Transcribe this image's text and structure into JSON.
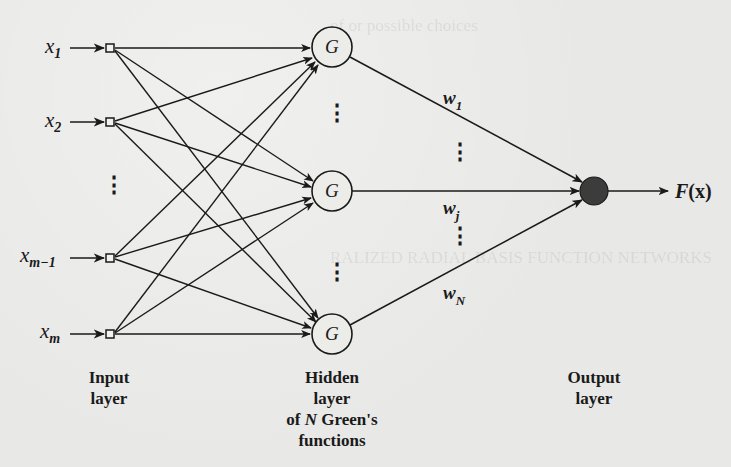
{
  "diagram": {
    "type": "radial-basis-function-network",
    "inputs": {
      "labels": [
        {
          "base": "x",
          "sub": "1"
        },
        {
          "base": "x",
          "sub": "2"
        },
        {
          "base": "x",
          "sub": "m−1"
        },
        {
          "base": "x",
          "sub": "m"
        }
      ],
      "ellipsis": "⋮",
      "layer_label_line1": "Input",
      "layer_label_line2": "layer"
    },
    "hidden": {
      "node_symbol": "G",
      "node_count_shown": 3,
      "ellipsis": "⋮",
      "layer_label_line1": "Hidden",
      "layer_label_line2": "layer",
      "layer_label_line3_prefix": "of ",
      "layer_label_line3_var": "N",
      "layer_label_line3_suffix": " Green's",
      "layer_label_line4": "functions"
    },
    "weights": [
      {
        "base": "w",
        "sub": "1"
      },
      {
        "base": "w",
        "sub": "j"
      },
      {
        "base": "w",
        "sub": "N"
      }
    ],
    "weights_ellipsis": "⋮",
    "output": {
      "node_color": "#3c3c3c",
      "label_func": "F",
      "label_open": "(",
      "label_arg": "x",
      "label_close": ")",
      "layer_label_line1": "Output",
      "layer_label_line2": "layer"
    }
  },
  "colors": {
    "background": "#e8e8e6",
    "ink": "#1a1a1a",
    "output_fill": "#3c3c3c"
  }
}
